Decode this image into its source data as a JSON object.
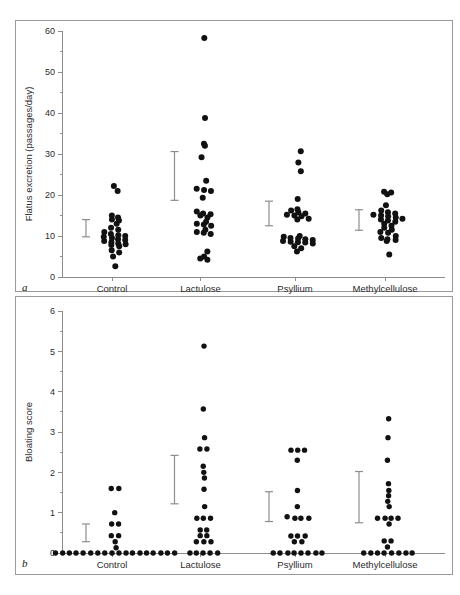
{
  "figure": {
    "panel_a_letter": "a",
    "panel_b_letter": "b",
    "background_color": "#ffffff",
    "dot_color": "#111111",
    "axis_color": "#8d8d8d",
    "errorbar_color": "#8d8d8d"
  },
  "chart_data": [
    {
      "type": "scatter",
      "panel": "a",
      "title": "",
      "xlabel": "",
      "ylabel": "Flatus excretion (passages/day)",
      "ylim": [
        0,
        60
      ],
      "yticks": [
        0,
        10,
        20,
        30,
        40,
        50,
        60
      ],
      "ytick_labels": [
        "0",
        "10",
        "20",
        "30",
        "40",
        "50",
        "60"
      ],
      "yminor_ticks": [
        5,
        15,
        25,
        35,
        45,
        55
      ],
      "grid": false,
      "legend": "none",
      "categories": [
        "Control",
        "Lactulose",
        "Psyllium",
        "Methylcellulose"
      ],
      "series": [
        {
          "name": "Control",
          "values": [
            22.2,
            21.0,
            15.0,
            14.5,
            14.0,
            13.8,
            13.0,
            12.0,
            11.5,
            11.0,
            10.5,
            10.2,
            10.0,
            9.8,
            9.5,
            9.2,
            9.0,
            8.8,
            8.5,
            8.2,
            8.0,
            7.8,
            7.5,
            6.5,
            6.0,
            5.0,
            2.6
          ],
          "mean": 11.9,
          "error_low": 9.8,
          "error_high": 14.0
        },
        {
          "name": "Lactulose",
          "values": [
            58.3,
            38.8,
            32.5,
            32.0,
            29.2,
            23.5,
            21.5,
            21.2,
            21.0,
            19.3,
            16.0,
            15.5,
            15.3,
            15.0,
            14.5,
            13.5,
            13.0,
            12.8,
            12.5,
            11.5,
            11.0,
            10.8,
            10.5,
            6.2,
            5.0,
            4.5,
            4.2
          ],
          "mean": 24.7,
          "error_low": 18.7,
          "error_high": 30.6
        },
        {
          "name": "Psyllium",
          "values": [
            30.7,
            27.9,
            25.8,
            19.0,
            16.5,
            16.2,
            15.8,
            15.5,
            15.2,
            15.0,
            14.8,
            14.2,
            14.0,
            10.0,
            9.8,
            9.5,
            9.4,
            9.2,
            9.0,
            8.8,
            8.6,
            8.5,
            8.4,
            8.2,
            7.5,
            7.0,
            6.2
          ],
          "mean": 15.5,
          "error_low": 12.5,
          "error_high": 18.5
        },
        {
          "name": "Methylcellulose",
          "values": [
            20.8,
            20.6,
            20.2,
            17.5,
            16.2,
            15.8,
            15.5,
            15.2,
            15.0,
            14.8,
            14.5,
            14.2,
            14.0,
            13.8,
            13.5,
            13.0,
            12.5,
            12.0,
            11.5,
            11.0,
            10.8,
            10.0,
            9.5,
            9.2,
            9.0,
            8.8,
            5.5
          ],
          "mean": 14.4,
          "error_low": 11.4,
          "error_high": 16.4
        }
      ]
    },
    {
      "type": "scatter",
      "panel": "b",
      "title": "",
      "xlabel": "",
      "ylabel": "Bloating score",
      "ylim": [
        0,
        6
      ],
      "yticks": [
        0,
        1,
        2,
        3,
        4,
        5,
        6
      ],
      "ytick_labels": [
        "0",
        "1",
        "2",
        "3",
        "4",
        "5",
        "6"
      ],
      "yminor_ticks": [
        0.5,
        1.5,
        2.5,
        3.5,
        4.5,
        5.5
      ],
      "grid": false,
      "legend": "none",
      "categories": [
        "Control",
        "Lactulose",
        "Psyllium",
        "Methylcellulose"
      ],
      "series": [
        {
          "name": "Control",
          "values": [
            1.6,
            1.6,
            1.0,
            0.72,
            0.72,
            0.43,
            0.43,
            0.28,
            0.13,
            0,
            0,
            0,
            0,
            0,
            0,
            0,
            0,
            0,
            0,
            0,
            0,
            0,
            0,
            0,
            0,
            0,
            0
          ],
          "mean": 0.42,
          "error_low": 0.28,
          "error_high": 0.72
        },
        {
          "name": "Lactulose",
          "values": [
            5.13,
            3.57,
            2.86,
            2.58,
            2.58,
            2.15,
            2.0,
            1.86,
            1.58,
            1.15,
            0.86,
            0.86,
            0.86,
            0.57,
            0.57,
            0.43,
            0.43,
            0.28,
            0.28,
            0.28,
            0,
            0,
            0,
            0,
            0
          ],
          "mean": 1.82,
          "error_low": 1.22,
          "error_high": 2.42
        },
        {
          "name": "Psyllium",
          "values": [
            2.55,
            2.55,
            2.55,
            2.3,
            1.55,
            1.15,
            0.9,
            0.86,
            0.86,
            0.86,
            0.42,
            0.42,
            0.42,
            0.28,
            0.28,
            0,
            0,
            0,
            0,
            0,
            0,
            0,
            0
          ],
          "mean": 1.15,
          "error_low": 0.78,
          "error_high": 1.52
        },
        {
          "name": "Methylcellulose",
          "values": [
            3.33,
            2.86,
            2.3,
            1.72,
            1.55,
            1.42,
            1.28,
            1.15,
            0.86,
            0.86,
            0.86,
            0.86,
            0.72,
            0.3,
            0.3,
            0.15,
            0,
            0,
            0,
            0,
            0,
            0,
            0,
            0
          ],
          "mean": 1.4,
          "error_low": 0.75,
          "error_high": 2.02
        }
      ]
    }
  ]
}
